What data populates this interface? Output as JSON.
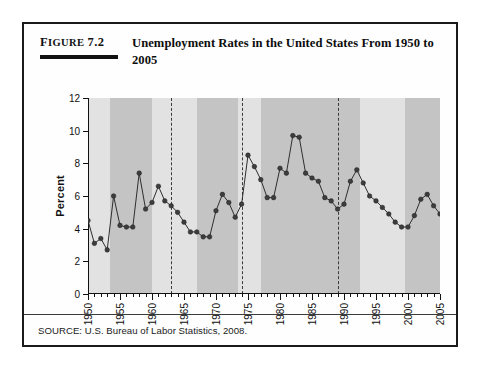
{
  "figure": {
    "label_small": "IGURE",
    "label_first_letter": "F",
    "label_number": "7.2",
    "title": "Unemployment Rates in the United States From 1950 to 2005",
    "source": "SOURCE: U.S. Bureau of Labor Statistics, 2008."
  },
  "colors": {
    "ink": "#111111",
    "marker": "#3d3d3d",
    "line": "#2e2e2e",
    "band_light": "#e2e2e2",
    "band_dark": "#c4c4c4",
    "plot_background": "#fdfdfd",
    "dashed_line": "#3a3a3a"
  },
  "chart_data": {
    "type": "line",
    "title": "Unemployment Rates in the United States From 1950 to 2005",
    "xlabel": "",
    "ylabel": "Percent",
    "xlim": [
      1950,
      2005
    ],
    "ylim": [
      0,
      12
    ],
    "ytick_step": 2,
    "yticks": [
      0,
      2,
      4,
      6,
      8,
      10,
      12
    ],
    "xticks_major": [
      1950,
      1955,
      1960,
      1965,
      1970,
      1975,
      1980,
      1985,
      1990,
      1995,
      2000,
      2005
    ],
    "xtick_labels": [
      "1950",
      "1955",
      "1960",
      "1965",
      "1970",
      "1975",
      "1980",
      "1985",
      "1990",
      "1995",
      "2000",
      "2005"
    ],
    "xtick_minor_step": 1,
    "grid": false,
    "legend": "none",
    "markers": "filled-circle",
    "x": [
      1950,
      1951,
      1952,
      1953,
      1954,
      1955,
      1956,
      1957,
      1958,
      1959,
      1960,
      1961,
      1962,
      1963,
      1964,
      1965,
      1966,
      1967,
      1968,
      1969,
      1970,
      1971,
      1972,
      1973,
      1974,
      1975,
      1976,
      1977,
      1978,
      1979,
      1980,
      1981,
      1982,
      1983,
      1984,
      1985,
      1986,
      1987,
      1988,
      1989,
      1990,
      1991,
      1992,
      1993,
      1994,
      1995,
      1996,
      1997,
      1998,
      1999,
      2000,
      2001,
      2002,
      2003,
      2004,
      2005
    ],
    "values": [
      4.5,
      3.1,
      3.4,
      2.7,
      6.0,
      4.2,
      4.1,
      4.1,
      7.4,
      5.2,
      5.6,
      6.6,
      5.7,
      5.4,
      5.0,
      4.4,
      3.8,
      3.8,
      3.5,
      3.5,
      5.1,
      6.1,
      5.6,
      4.7,
      5.5,
      8.5,
      7.8,
      7.0,
      5.9,
      5.9,
      7.7,
      7.4,
      9.7,
      9.6,
      7.4,
      7.1,
      6.9,
      5.9,
      5.7,
      5.2,
      5.5,
      6.9,
      7.6,
      6.8,
      6.0,
      5.7,
      5.3,
      4.9,
      4.4,
      4.1,
      4.1,
      4.8,
      5.8,
      6.1,
      5.4,
      4.9
    ],
    "shaded_bands": [
      {
        "from": 1950,
        "to": 1953.5,
        "shade": "light"
      },
      {
        "from": 1953.5,
        "to": 1960.0,
        "shade": "dark"
      },
      {
        "from": 1960.0,
        "to": 1967.0,
        "shade": "light"
      },
      {
        "from": 1967.0,
        "to": 1973.5,
        "shade": "dark"
      },
      {
        "from": 1973.5,
        "to": 1977.0,
        "shade": "light"
      },
      {
        "from": 1977.0,
        "to": 1992.5,
        "shade": "dark"
      },
      {
        "from": 1992.5,
        "to": 1999.5,
        "shade": "light"
      },
      {
        "from": 1999.5,
        "to": 2005,
        "shade": "dark"
      }
    ],
    "reference_lines": [
      1963,
      1974,
      1989
    ],
    "annotations": []
  }
}
